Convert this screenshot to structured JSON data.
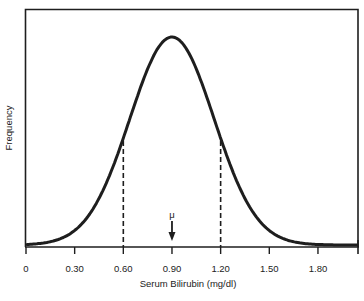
{
  "chart_data": {
    "type": "line",
    "title": "",
    "xlabel": "Serum Bilirubin  (mg/dl)",
    "ylabel": "Frequency",
    "xlim": [
      0,
      2.05
    ],
    "x_ticks": [
      0,
      0.3,
      0.6,
      0.9,
      1.2,
      1.5,
      1.8
    ],
    "x_tick_labels": [
      "0",
      "0.30",
      "0.60",
      "0.90",
      "1.20",
      "1.50",
      "1.80"
    ],
    "grid": false,
    "legend": null,
    "series": [
      {
        "name": "Normal distribution",
        "distribution": "normal",
        "mean": 0.9,
        "sd": 0.26
      }
    ],
    "annotations": [
      {
        "type": "arrow",
        "label": "μ",
        "x": 0.9
      },
      {
        "type": "dashed-vline",
        "x": 0.6
      },
      {
        "type": "dashed-vline",
        "x": 1.2
      }
    ],
    "colors": {
      "line": "#1e1e1e",
      "axis": "#1e1e1e",
      "background": "#ffffff"
    }
  },
  "labels": {
    "mu": "μ",
    "xlabel": "Serum Bilirubin  (mg/dl)",
    "ylabel": "Frequency",
    "ticks": [
      "0",
      "0.30",
      "0.60",
      "0.90",
      "1.20",
      "1.50",
      "1.80"
    ]
  }
}
